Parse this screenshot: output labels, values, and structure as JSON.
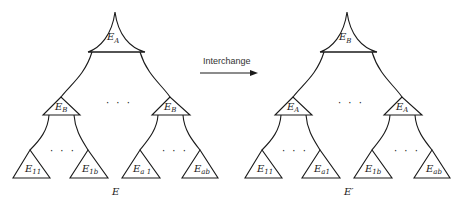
{
  "diagram": {
    "type": "tree-interchange",
    "arrow_label": "Interchange",
    "left_tree": {
      "caption": "E",
      "root": {
        "base": "E",
        "sub": "A"
      },
      "middle": [
        {
          "base": "E",
          "sub": "B"
        },
        {
          "base": "E",
          "sub": "B"
        }
      ],
      "leaves": [
        {
          "base": "E",
          "sub": "11"
        },
        {
          "base": "E",
          "sub": "1b"
        },
        {
          "base": "E",
          "sub": "a 1"
        },
        {
          "base": "E",
          "sub": "ab"
        }
      ],
      "ellipsis": "· · ·"
    },
    "right_tree": {
      "caption": "E′",
      "root": {
        "base": "E",
        "sub": "B"
      },
      "middle": [
        {
          "base": "E",
          "sub": "A"
        },
        {
          "base": "E",
          "sub": "A"
        }
      ],
      "leaves": [
        {
          "base": "E",
          "sub": "11"
        },
        {
          "base": "E",
          "sub": "a1"
        },
        {
          "base": "E",
          "sub": "1b"
        },
        {
          "base": "E",
          "sub": "ab"
        }
      ],
      "ellipsis": "· · ·"
    }
  }
}
